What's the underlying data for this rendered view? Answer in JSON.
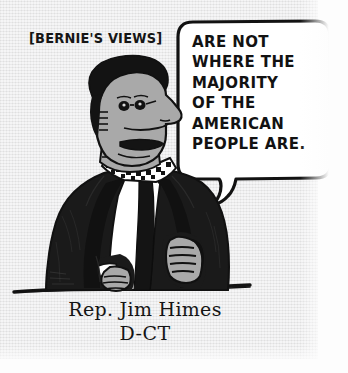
{
  "cartoon": {
    "bracket_label": "[BERNIE'S VIEWS]",
    "speech_lines": [
      "ARE NOT",
      "WHERE THE",
      "MAJORITY",
      "OF THE",
      "AMERICAN",
      "PEOPLE ARE."
    ],
    "caption_name": "Rep. Jim Himes",
    "caption_party": "D-CT",
    "colors": {
      "paper": "#ececed",
      "ink": "#111111",
      "skin": "#a9a9a9",
      "suit": "#1a1a1a",
      "shirt": "#ffffff",
      "bubble_fill": "#ffffff"
    },
    "figure": {
      "description": "caricature-man-in-suit",
      "hair": "dark-swept-hair",
      "face": "long-nose-profile-with-glasses",
      "collar": "checkered-collar-band",
      "tie": "dark-necktie",
      "hands": "two-hands-on-table",
      "table": "horizontal-table-edge-line"
    }
  }
}
